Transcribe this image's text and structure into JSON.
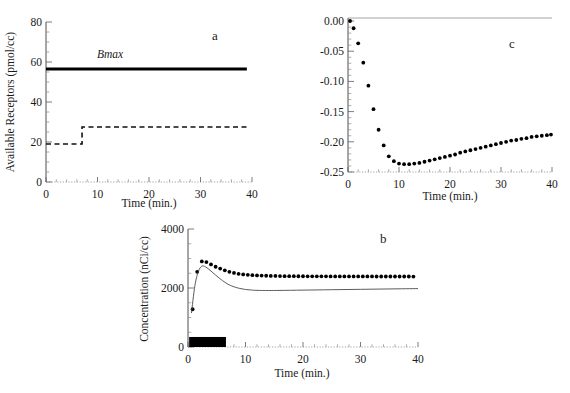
{
  "figure": {
    "background": "#ffffff",
    "ink": "#111111"
  },
  "panels": {
    "a": {
      "letter": "a",
      "xlabel": "Time (min.)",
      "ylabel": "Available Receptors (pmol/cc)",
      "annotation": "Bmax"
    },
    "b": {
      "letter": "b",
      "xlabel": "Time (min.)",
      "ylabel": "Concentration (nCi/cc)"
    },
    "c": {
      "letter": "c",
      "xlabel": "Time (min.)",
      "ylabel": ""
    }
  },
  "chart_data": [
    {
      "id": "panel-a",
      "type": "line",
      "title": "a",
      "xlabel": "Time (min.)",
      "ylabel": "Available Receptors (pmol/cc)",
      "xlim": [
        0,
        40
      ],
      "ylim": [
        0,
        80
      ],
      "xticks": [
        0,
        10,
        20,
        30,
        40
      ],
      "yticks": [
        0,
        20,
        40,
        60,
        80
      ],
      "xtick_labels": [
        "0",
        "10",
        "20",
        "30",
        "40"
      ],
      "ytick_labels": [
        "0",
        "20",
        "40",
        "60",
        "80"
      ],
      "grid": false,
      "legend": false,
      "annotations": [
        {
          "text": "Bmax",
          "x": 14.5,
          "y": 62,
          "style": "italic"
        }
      ],
      "series": [
        {
          "name": "Bmax (total receptors)",
          "style": "solid-thick",
          "x": [
            0,
            39
          ],
          "values": [
            56.5,
            56.5
          ]
        },
        {
          "name": "Available receptors (step)",
          "style": "dashed",
          "x": [
            0,
            7,
            7,
            39
          ],
          "values": [
            19,
            19,
            27.5,
            27.5
          ]
        }
      ]
    },
    {
      "id": "panel-b",
      "type": "line",
      "title": "b",
      "xlabel": "Time (min.)",
      "ylabel": "Concentration (nCi/cc)",
      "xlim": [
        0,
        40
      ],
      "ylim": [
        0,
        4000
      ],
      "xticks": [
        0,
        10,
        20,
        30,
        40
      ],
      "yticks": [
        0,
        2000,
        4000
      ],
      "xtick_labels": [
        "0",
        "10",
        "20",
        "30",
        "40"
      ],
      "ytick_labels": [
        "0",
        "2000",
        "4000"
      ],
      "grid": false,
      "legend": false,
      "annotations": [
        {
          "text": "infusion bar",
          "x0": 0.2,
          "x1": 6.6,
          "y0": 0,
          "y1": 340,
          "style": "filled-black-rect"
        }
      ],
      "series": [
        {
          "name": "Measured concentration (dots)",
          "style": "dots",
          "x": [
            0.8,
            1.6,
            2.4,
            3.2,
            4.0,
            4.8,
            5.6,
            6.4,
            7.2,
            8.0,
            8.8,
            9.6,
            10.4,
            11.2,
            12.0,
            12.8,
            13.6,
            14.4,
            15.2,
            16.0,
            16.8,
            17.6,
            18.4,
            19.2,
            20.0,
            20.8,
            21.6,
            22.4,
            23.2,
            24.0,
            24.8,
            25.6,
            26.4,
            27.2,
            28.0,
            28.8,
            29.6,
            30.4,
            31.2,
            32.0,
            32.8,
            33.6,
            34.4,
            35.2,
            36.0,
            36.8,
            37.6,
            38.4,
            39.2
          ],
          "values": [
            1280,
            2550,
            2900,
            2880,
            2800,
            2720,
            2660,
            2600,
            2550,
            2510,
            2480,
            2460,
            2445,
            2435,
            2425,
            2420,
            2415,
            2410,
            2408,
            2405,
            2402,
            2400,
            2400,
            2398,
            2398,
            2397,
            2396,
            2396,
            2395,
            2395,
            2394,
            2394,
            2393,
            2393,
            2392,
            2392,
            2392,
            2391,
            2391,
            2391,
            2390,
            2390,
            2390,
            2390,
            2389,
            2389,
            2389,
            2389,
            2388
          ]
        },
        {
          "name": "Model concentration (solid line)",
          "style": "solid",
          "x": [
            0.6,
            1.2,
            1.8,
            2.4,
            3.0,
            3.6,
            4.2,
            4.8,
            5.4,
            6.0,
            6.6,
            7.2,
            8.0,
            9.0,
            10.0,
            11.0,
            12.0,
            14.0,
            16.0,
            20.0,
            25.0,
            30.0,
            35.0,
            40.0
          ],
          "values": [
            1150,
            2080,
            2560,
            2740,
            2720,
            2640,
            2540,
            2440,
            2340,
            2250,
            2170,
            2105,
            2040,
            1985,
            1950,
            1930,
            1920,
            1915,
            1918,
            1928,
            1942,
            1955,
            1968,
            1980
          ]
        }
      ]
    },
    {
      "id": "panel-c",
      "type": "scatter",
      "title": "c",
      "xlabel": "Time (min.)",
      "ylabel": "",
      "xlim": [
        0,
        40
      ],
      "ylim": [
        -0.25,
        0.005
      ],
      "xticks": [
        0,
        10,
        20,
        30,
        40
      ],
      "yticks": [
        0.0,
        -0.05,
        -0.1,
        -0.15,
        -0.2,
        -0.25
      ],
      "xtick_labels": [
        "0",
        "10",
        "20",
        "30",
        "40"
      ],
      "ytick_labels": [
        "0.00",
        "-0.05",
        "-0.10",
        "-0.15",
        "-0.20",
        "-0.25"
      ],
      "grid": false,
      "legend": false,
      "reference_line": {
        "y": 0.0,
        "style": "solid-gray"
      },
      "series": [
        {
          "name": "Residual / difference",
          "style": "dots",
          "x": [
            0.4,
            1.1,
            2.0,
            3.0,
            4.0,
            5.0,
            6.0,
            7.0,
            8.0,
            9.0,
            10.0,
            11.0,
            12.0,
            13.0,
            14.0,
            15.0,
            16.0,
            17.0,
            18.0,
            19.0,
            20.0,
            21.0,
            22.0,
            23.0,
            24.0,
            25.0,
            26.0,
            27.0,
            28.0,
            29.0,
            30.0,
            31.0,
            32.0,
            33.0,
            34.0,
            35.0,
            36.0,
            37.0,
            38.0,
            39.0,
            39.8
          ],
          "values": [
            0.0,
            -0.012,
            -0.037,
            -0.069,
            -0.107,
            -0.146,
            -0.18,
            -0.206,
            -0.224,
            -0.232,
            -0.236,
            -0.237,
            -0.237,
            -0.236,
            -0.235,
            -0.233,
            -0.231,
            -0.229,
            -0.227,
            -0.225,
            -0.223,
            -0.221,
            -0.218,
            -0.216,
            -0.214,
            -0.212,
            -0.21,
            -0.208,
            -0.206,
            -0.204,
            -0.202,
            -0.2,
            -0.198,
            -0.197,
            -0.195,
            -0.194,
            -0.192,
            -0.191,
            -0.19,
            -0.189,
            -0.188
          ]
        }
      ]
    }
  ]
}
